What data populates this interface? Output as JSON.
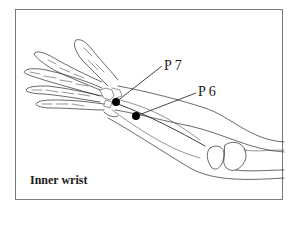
{
  "figure": {
    "caption": "Inner wrist",
    "points": [
      {
        "id": "p7",
        "label": "P 7",
        "dot": [
          116,
          102
        ],
        "label_pos": [
          164,
          58
        ]
      },
      {
        "id": "p6",
        "label": "P 6",
        "dot": [
          136,
          116
        ],
        "label_pos": [
          198,
          84
        ]
      }
    ],
    "colors": {
      "line": "#2a2a2a",
      "dot": "#000000",
      "frame": "#7a7a7a"
    }
  }
}
